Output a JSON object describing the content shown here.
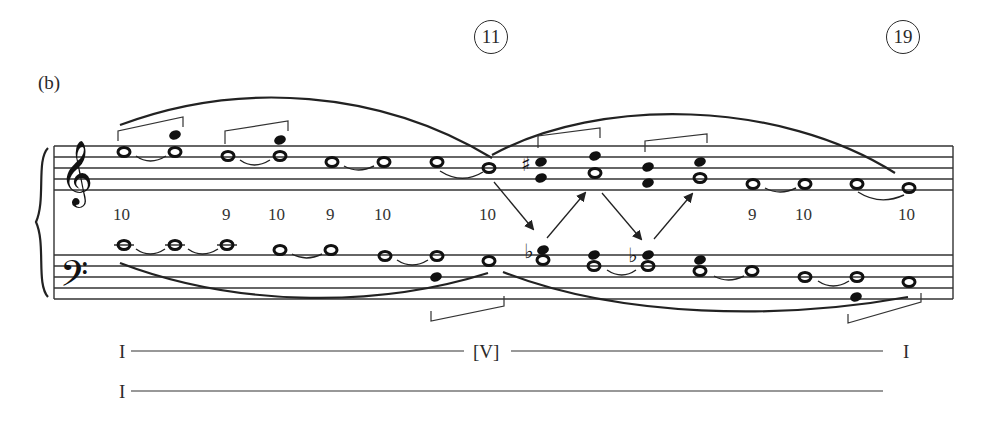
{
  "example_label": "(b)",
  "measure_markers": [
    {
      "label": "11",
      "x": 474,
      "y": 20
    },
    {
      "label": "19",
      "x": 886,
      "y": 20
    }
  ],
  "interval_figures": [
    {
      "label": "10",
      "x": 113,
      "y": 205
    },
    {
      "label": "9",
      "x": 220,
      "y": 205
    },
    {
      "label": "10",
      "x": 268,
      "y": 205
    },
    {
      "label": "9",
      "x": 324,
      "y": 205
    },
    {
      "label": "10",
      "x": 374,
      "y": 205
    },
    {
      "label": "10",
      "x": 479,
      "y": 205
    },
    {
      "label": "9",
      "x": 748,
      "y": 205
    },
    {
      "label": "10",
      "x": 795,
      "y": 205
    },
    {
      "label": "10",
      "x": 898,
      "y": 205
    }
  ],
  "harmonic_analysis": {
    "row1": {
      "start": "I",
      "middle": "[V]",
      "end": "I"
    },
    "row2": {
      "start": "I"
    }
  },
  "clefs": {
    "treble": "treble-clef",
    "bass": "bass-clef"
  },
  "accidentals": {
    "sharp": "♯",
    "flat": "♭"
  }
}
